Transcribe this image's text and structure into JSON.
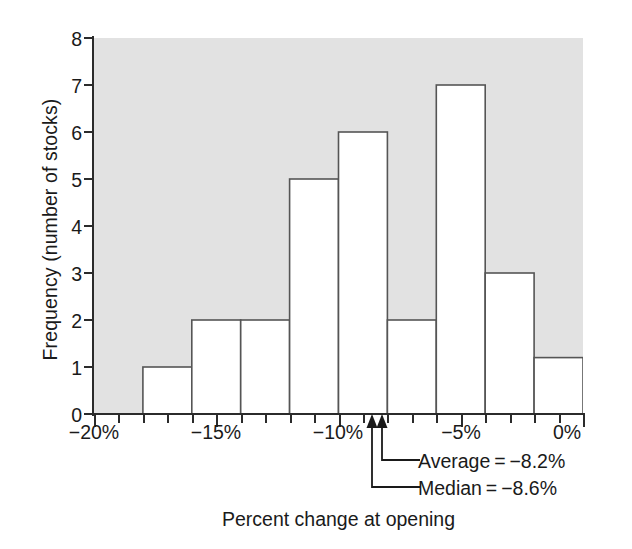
{
  "chart_data": {
    "type": "bar",
    "title": "",
    "xlabel": "Percent change at opening",
    "ylabel": "Frequency (number of stocks)",
    "xlim": [
      -20,
      0
    ],
    "ylim": [
      0,
      8
    ],
    "grid": false,
    "legend": "none",
    "bin_width": 2,
    "x_tick_labels": [
      "−20%",
      "−15%",
      "−10%",
      "−5%",
      "0%"
    ],
    "x_tick_values": [
      -20,
      -15,
      -10,
      -5,
      0
    ],
    "x_minor_tick_step": 1,
    "y_tick_labels": [
      "0",
      "1",
      "2",
      "3",
      "4",
      "5",
      "6",
      "7",
      "8"
    ],
    "y_tick_values": [
      0,
      1,
      2,
      3,
      4,
      5,
      6,
      7,
      8
    ],
    "bins": [
      {
        "left": -18,
        "right": -16,
        "value": 1
      },
      {
        "left": -16,
        "right": -14,
        "value": 2
      },
      {
        "left": -14,
        "right": -12,
        "value": 2
      },
      {
        "left": -12,
        "right": -10,
        "value": 5
      },
      {
        "left": -10,
        "right": -8,
        "value": 6
      },
      {
        "left": -8,
        "right": -6,
        "value": 2
      },
      {
        "left": -6,
        "right": -4,
        "value": 7
      },
      {
        "left": -4,
        "right": -2,
        "value": 3
      },
      {
        "left": -2,
        "right": 0,
        "value": 1.2
      }
    ],
    "categories": [
      "-18 to -16",
      "-16 to -14",
      "-14 to -12",
      "-12 to -10",
      "-10 to -8",
      "-8 to -6",
      "-6 to -4",
      "-4 to -2",
      "-2 to 0"
    ],
    "values": [
      1,
      2,
      2,
      5,
      6,
      2,
      7,
      3,
      1.2
    ],
    "annotations": [
      {
        "label": "Average = −8.2%",
        "x": -8.2,
        "marker": "up-arrow"
      },
      {
        "label": "Median = −8.6%",
        "x": -8.6,
        "marker": "up-arrow"
      }
    ],
    "colors": {
      "plot_background": "#e2e2e2",
      "bar_fill": "#ffffff",
      "bar_stroke": "#555555",
      "axis": "#2b2b2b",
      "text": "#1a1a1a",
      "page_background": "#ffffff"
    }
  },
  "axis": {
    "y_title": "Frequency (number of stocks)",
    "x_title": "Percent change at opening",
    "y_ticks": [
      "8",
      "7",
      "6",
      "5",
      "4",
      "3",
      "2",
      "1",
      "0"
    ],
    "x_ticks": [
      "−20%",
      "−15%",
      "−10%",
      "−5%",
      "0%"
    ]
  },
  "callouts": {
    "average": "Average = −8.2%",
    "median": "Median = −8.6%"
  }
}
